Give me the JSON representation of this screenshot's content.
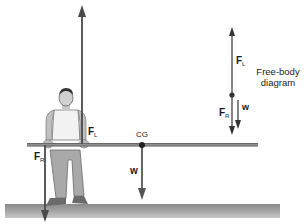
{
  "figure": {
    "title": "Free-body diagram",
    "caption_line1": "Free-body",
    "caption_line2": "diagram"
  },
  "labels": {
    "force_left": {
      "main": "F",
      "sub": "L"
    },
    "force_right": {
      "main": "F",
      "sub": "R"
    },
    "center_of_gravity": "CG",
    "weight": "w"
  },
  "free_body_labels": {
    "force_left": {
      "main": "F",
      "sub": "L"
    },
    "force_right": {
      "main": "F",
      "sub": "R"
    },
    "weight": "w"
  },
  "colors": {
    "arrow": "#4a4a4a",
    "bar": "#6d6d6d",
    "ground": "#9a9a9a",
    "figure_gray": "#a8a8a8"
  }
}
